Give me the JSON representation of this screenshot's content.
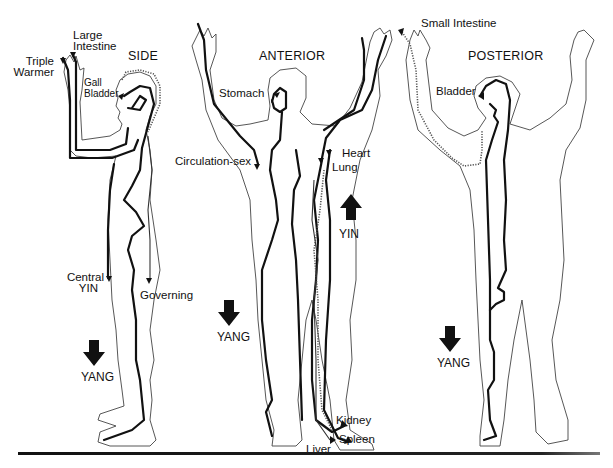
{
  "diagram": {
    "type": "acupuncture-meridian-figures",
    "views": [
      {
        "title": "SIDE",
        "labels": {
          "triple_warmer": "Triple\nWarmer",
          "triple_warmer_l1": "Triple",
          "triple_warmer_l2": "Warmer",
          "large_intestine_l1": "Large",
          "large_intestine_l2": "Intestine",
          "gall_l1": "Gall",
          "gall_l2": "Bladder",
          "central_l1": "Central",
          "central_l2": "YIN",
          "governing": "Governing"
        },
        "flow_arrow": {
          "direction": "down",
          "label": "YANG"
        }
      },
      {
        "title": "ANTERIOR",
        "labels": {
          "stomach": "Stomach",
          "circulation_sex": "Circulation-sex",
          "heart": "Heart",
          "lung": "Lung",
          "kidney": "Kidney",
          "spleen": "Spleen",
          "liver": "Liver"
        },
        "flow_arrows": [
          {
            "direction": "up",
            "label": "YIN"
          },
          {
            "direction": "down",
            "label": "YANG"
          }
        ]
      },
      {
        "title": "POSTERIOR",
        "labels": {
          "small_intestine": "Small Intestine",
          "bladder": "Bladder"
        },
        "flow_arrow": {
          "direction": "down",
          "label": "YANG"
        }
      }
    ],
    "colors": {
      "ink": "#111111",
      "outline": "#444444",
      "background": "#ffffff"
    }
  }
}
